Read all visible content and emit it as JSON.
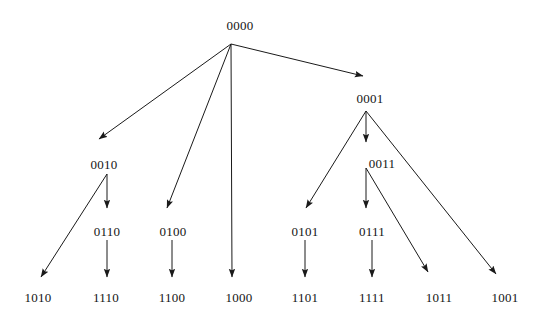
{
  "diagram": {
    "kind": "directed-tree",
    "background_color": "#ffffff",
    "line_color": "#1a1a1a",
    "text_color": "#141414",
    "nodes": [
      {
        "id": "n0000",
        "label": "0000",
        "x": 240,
        "y": 19,
        "level": 0
      },
      {
        "id": "n0001",
        "label": "0001",
        "x": 370,
        "y": 92,
        "level": 1
      },
      {
        "id": "n0010",
        "label": "0010",
        "x": 104,
        "y": 158,
        "level": 1
      },
      {
        "id": "n0011",
        "label": "0011",
        "x": 382,
        "y": 157,
        "level": 2
      },
      {
        "id": "n0100",
        "label": "0100",
        "x": 173,
        "y": 225,
        "level": 2
      },
      {
        "id": "n0101",
        "label": "0101",
        "x": 305,
        "y": 225,
        "level": 3
      },
      {
        "id": "n0110",
        "label": "0110",
        "x": 107,
        "y": 225,
        "level": 2
      },
      {
        "id": "n0111",
        "label": "0111",
        "x": 372,
        "y": 225,
        "level": 3
      },
      {
        "id": "n1000",
        "label": "1000",
        "x": 239,
        "y": 291,
        "level": 1
      },
      {
        "id": "n1001",
        "label": "1001",
        "x": 505,
        "y": 291,
        "level": 2
      },
      {
        "id": "n1010",
        "label": "1010",
        "x": 38,
        "y": 291,
        "level": 2
      },
      {
        "id": "n1011",
        "label": "1011",
        "x": 439,
        "y": 291,
        "level": 3
      },
      {
        "id": "n1100",
        "label": "1100",
        "x": 172,
        "y": 291,
        "level": 3
      },
      {
        "id": "n1101",
        "label": "1101",
        "x": 305,
        "y": 291,
        "level": 4
      },
      {
        "id": "n1110",
        "label": "1110",
        "x": 106,
        "y": 291,
        "level": 3
      },
      {
        "id": "n1111",
        "label": "1111",
        "x": 372,
        "y": 291,
        "level": 4
      }
    ],
    "edges": [
      {
        "id": "e-0000-0010",
        "from": "0000",
        "to": "0010",
        "x1": 231,
        "y1": 44,
        "x2": 99,
        "y2": 139
      },
      {
        "id": "e-0000-0100",
        "from": "0000",
        "to": "0100",
        "x1": 231,
        "y1": 44,
        "x2": 167,
        "y2": 208
      },
      {
        "id": "e-0000-1000",
        "from": "0000",
        "to": "1000",
        "x1": 231,
        "y1": 44,
        "x2": 232,
        "y2": 277
      },
      {
        "id": "e-0000-0001",
        "from": "0000",
        "to": "0001",
        "x1": 231,
        "y1": 44,
        "x2": 363,
        "y2": 76
      },
      {
        "id": "e-0010-0110",
        "from": "0010",
        "to": "0110",
        "x1": 107,
        "y1": 174,
        "x2": 107,
        "y2": 208
      },
      {
        "id": "e-0010-1010",
        "from": "0010",
        "to": "1010",
        "x1": 107,
        "y1": 174,
        "x2": 41,
        "y2": 277
      },
      {
        "id": "e-0110-1110",
        "from": "0110",
        "to": "1110",
        "x1": 107,
        "y1": 240,
        "x2": 107,
        "y2": 277
      },
      {
        "id": "e-0100-1100",
        "from": "0100",
        "to": "1100",
        "x1": 172,
        "y1": 240,
        "x2": 172,
        "y2": 277
      },
      {
        "id": "e-0001-0101",
        "from": "0001",
        "to": "0101",
        "x1": 366,
        "y1": 111,
        "x2": 306,
        "y2": 208
      },
      {
        "id": "e-0001-0011",
        "from": "0001",
        "to": "0011",
        "x1": 366,
        "y1": 111,
        "x2": 366,
        "y2": 142
      },
      {
        "id": "e-0001-1001",
        "from": "0001",
        "to": "1001",
        "x1": 366,
        "y1": 111,
        "x2": 496,
        "y2": 274
      },
      {
        "id": "e-0011-0111",
        "from": "0011",
        "to": "0111",
        "x1": 366,
        "y1": 168,
        "x2": 366,
        "y2": 208
      },
      {
        "id": "e-0011-1011",
        "from": "0011",
        "to": "1011",
        "x1": 366,
        "y1": 168,
        "x2": 428,
        "y2": 272
      },
      {
        "id": "e-0101-1101",
        "from": "0101",
        "to": "1101",
        "x1": 305,
        "y1": 240,
        "x2": 305,
        "y2": 277
      },
      {
        "id": "e-0111-1111",
        "from": "0111",
        "to": "1111",
        "x1": 372,
        "y1": 240,
        "x2": 372,
        "y2": 277
      }
    ]
  }
}
